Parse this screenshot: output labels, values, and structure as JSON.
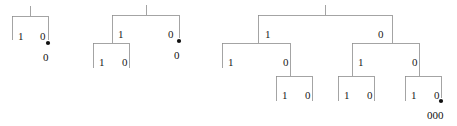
{
  "figure": {
    "background_color": "#ffffff",
    "line_color": "#8d8d8d",
    "text_color": "#1a1a1a",
    "marker_color": "#111111",
    "width": 457,
    "height": 126
  },
  "trees": [
    {
      "name": "tree-depth-1",
      "edge_labels": [
        {
          "text": "1",
          "x": 18,
          "y": 31
        },
        {
          "text": "0",
          "x": 40,
          "y": 31
        }
      ],
      "markers": [
        {
          "x": 48,
          "y": 43,
          "r": 2.1
        }
      ],
      "code_labels": [
        {
          "text": "0",
          "x": 43,
          "y": 52
        }
      ],
      "geometry": {
        "root_stem": {
          "x": 30,
          "y1": 6,
          "y2": 16
        },
        "bars": [
          {
            "x1": 12,
            "x2": 48,
            "y": 16
          }
        ],
        "legs": [
          {
            "x": 12,
            "y1": 16,
            "y2": 40
          },
          {
            "x": 48,
            "y1": 16,
            "y2": 40
          }
        ]
      }
    },
    {
      "name": "tree-depth-2-left",
      "edge_labels": [
        {
          "text": "1",
          "x": 118,
          "y": 29
        },
        {
          "text": "0",
          "x": 168,
          "y": 29
        },
        {
          "text": "1",
          "x": 99,
          "y": 57
        },
        {
          "text": "0",
          "x": 122,
          "y": 57
        }
      ],
      "markers": [
        {
          "x": 179,
          "y": 41,
          "r": 2.1
        }
      ],
      "code_labels": [
        {
          "text": "0",
          "x": 174,
          "y": 50
        }
      ],
      "geometry": {
        "root_stem": {
          "x": 146,
          "y1": 5,
          "y2": 15
        },
        "bars": [
          {
            "x1": 112,
            "x2": 179,
            "y": 15
          },
          {
            "x1": 93,
            "x2": 129,
            "y": 43
          }
        ],
        "legs": [
          {
            "x": 112,
            "y1": 15,
            "y2": 43
          },
          {
            "x": 179,
            "y1": 15,
            "y2": 38
          },
          {
            "x": 93,
            "y1": 43,
            "y2": 68
          },
          {
            "x": 129,
            "y1": 43,
            "y2": 68
          }
        ]
      }
    },
    {
      "name": "tree-depth-3",
      "edge_labels": [
        {
          "text": "1",
          "x": 265,
          "y": 29
        },
        {
          "text": "0",
          "x": 378,
          "y": 29
        },
        {
          "text": "1",
          "x": 228,
          "y": 57
        },
        {
          "text": "0",
          "x": 283,
          "y": 57
        },
        {
          "text": "1",
          "x": 358,
          "y": 57
        },
        {
          "text": "0",
          "x": 412,
          "y": 57
        },
        {
          "text": "1",
          "x": 282,
          "y": 90
        },
        {
          "text": "0",
          "x": 305,
          "y": 90
        },
        {
          "text": "1",
          "x": 344,
          "y": 90
        },
        {
          "text": "0",
          "x": 367,
          "y": 90
        },
        {
          "text": "1",
          "x": 411,
          "y": 90
        },
        {
          "text": "0",
          "x": 434,
          "y": 90
        }
      ],
      "markers": [
        {
          "x": 441,
          "y": 101,
          "r": 2.1
        }
      ],
      "code_labels": [
        {
          "text": "000",
          "x": 427,
          "y": 110
        }
      ],
      "geometry": {
        "root_stem": {
          "x": 325,
          "y1": 5,
          "y2": 15
        },
        "bars": [
          {
            "x1": 258,
            "x2": 392,
            "y": 15
          },
          {
            "x1": 222,
            "x2": 290,
            "y": 43
          },
          {
            "x1": 352,
            "x2": 419,
            "y": 43
          },
          {
            "x1": 276,
            "x2": 312,
            "y": 76
          },
          {
            "x1": 338,
            "x2": 374,
            "y": 76
          },
          {
            "x1": 405,
            "x2": 441,
            "y": 76
          }
        ],
        "legs": [
          {
            "x": 258,
            "y1": 15,
            "y2": 43
          },
          {
            "x": 392,
            "y1": 15,
            "y2": 43
          },
          {
            "x": 222,
            "y1": 43,
            "y2": 68
          },
          {
            "x": 290,
            "y1": 43,
            "y2": 76
          },
          {
            "x": 352,
            "y1": 43,
            "y2": 76
          },
          {
            "x": 419,
            "y1": 43,
            "y2": 76
          },
          {
            "x": 276,
            "y1": 76,
            "y2": 101
          },
          {
            "x": 312,
            "y1": 76,
            "y2": 101
          },
          {
            "x": 338,
            "y1": 76,
            "y2": 101
          },
          {
            "x": 374,
            "y1": 76,
            "y2": 101
          },
          {
            "x": 405,
            "y1": 76,
            "y2": 101
          },
          {
            "x": 441,
            "y1": 76,
            "y2": 98
          }
        ]
      }
    }
  ]
}
